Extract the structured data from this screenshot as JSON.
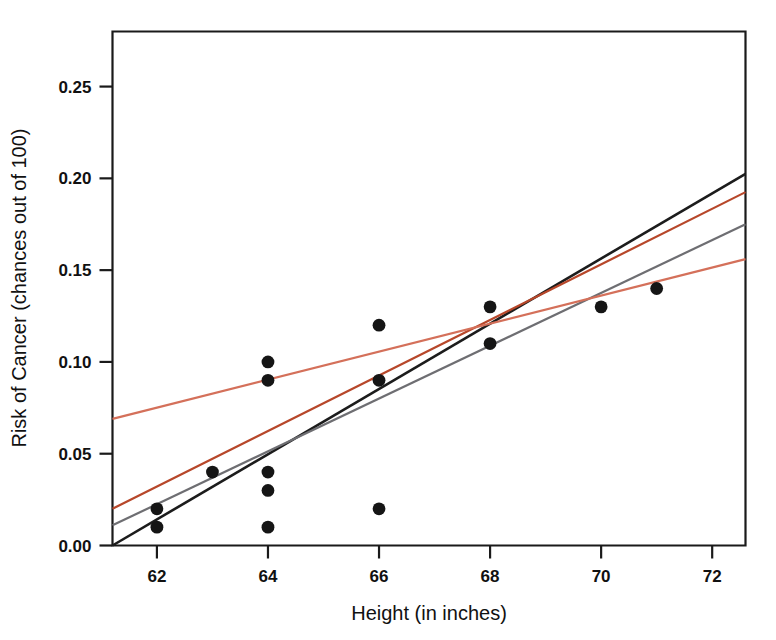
{
  "chart_data": {
    "type": "scatter",
    "title": "",
    "xlabel": "Height (in inches)",
    "ylabel": "Risk of Cancer (chances out of 100)",
    "xlim": [
      61.2,
      72.6
    ],
    "ylim": [
      0.0,
      0.28
    ],
    "grid": false,
    "legend": "none",
    "xticks": [
      "62",
      "64",
      "66",
      "68",
      "70",
      "72"
    ],
    "xtick_values": [
      62,
      64,
      66,
      68,
      70,
      72
    ],
    "yticks": [
      "0.00",
      "0.05",
      "0.10",
      "0.15",
      "0.20",
      "0.25"
    ],
    "ytick_values": [
      0.0,
      0.05,
      0.1,
      0.15,
      0.2,
      0.25
    ],
    "points": [
      {
        "x": 62,
        "y": 0.02
      },
      {
        "x": 62,
        "y": 0.01
      },
      {
        "x": 63,
        "y": 0.04
      },
      {
        "x": 64,
        "y": 0.1
      },
      {
        "x": 64,
        "y": 0.09
      },
      {
        "x": 64,
        "y": 0.04
      },
      {
        "x": 64,
        "y": 0.03
      },
      {
        "x": 64,
        "y": 0.01
      },
      {
        "x": 66,
        "y": 0.12
      },
      {
        "x": 66,
        "y": 0.09
      },
      {
        "x": 66,
        "y": 0.02
      },
      {
        "x": 68,
        "y": 0.13
      },
      {
        "x": 68,
        "y": 0.11
      },
      {
        "x": 70,
        "y": 0.13
      },
      {
        "x": 71,
        "y": 0.14
      }
    ],
    "series": [
      {
        "name": "steep-black-line",
        "type": "line",
        "color": "#1c1c1c",
        "x": [
          61.2,
          72.6
        ],
        "values": [
          0.0,
          0.2025
        ]
      },
      {
        "name": "dark-orange-line",
        "type": "line",
        "color": "#b7472a",
        "x": [
          61.2,
          72.6
        ],
        "values": [
          0.02,
          0.1925
        ]
      },
      {
        "name": "gray-line",
        "type": "line",
        "color": "#6e6e72",
        "x": [
          61.2,
          72.6
        ],
        "values": [
          0.011,
          0.175
        ]
      },
      {
        "name": "light-salmon-line",
        "type": "line",
        "color": "#d4705a",
        "x": [
          61.2,
          72.6
        ],
        "values": [
          0.069,
          0.156
        ]
      }
    ]
  },
  "colors": {
    "axis": "#1a1a1a",
    "point": "#151515",
    "line_black": "#1c1c1c",
    "line_dark_orange": "#b7472a",
    "line_gray": "#6e6e72",
    "line_salmon": "#d4705a"
  }
}
